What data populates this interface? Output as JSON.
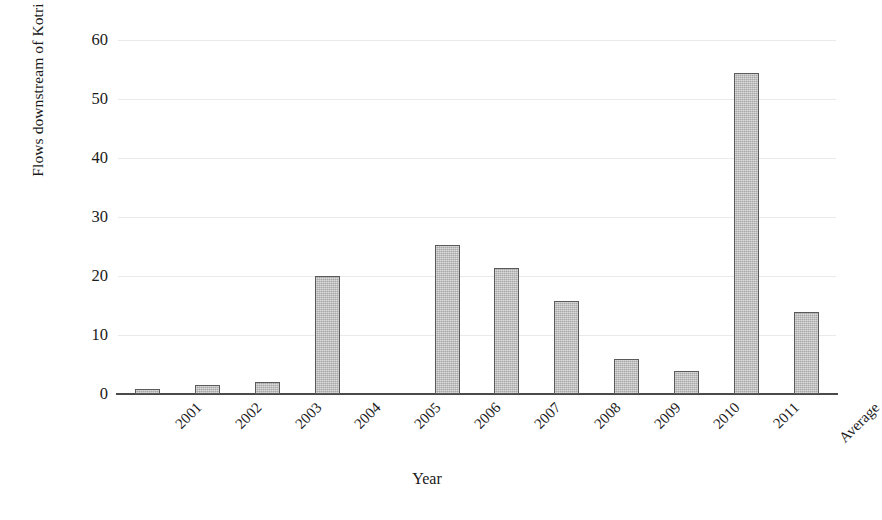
{
  "chart_data": {
    "type": "bar",
    "title": "",
    "xlabel": "Year",
    "ylabel": "Flows downstream of Kotri Barrage ( MAF )",
    "categories": [
      "2001",
      "2002",
      "2003",
      "2004",
      "2005",
      "2006",
      "2007",
      "2008",
      "2009",
      "2010",
      "2011",
      "Average"
    ],
    "values": [
      0.9,
      1.6,
      2.1,
      20.0,
      0.0,
      25.3,
      21.4,
      15.7,
      6.0,
      3.9,
      54.4,
      13.9
    ],
    "ylim": [
      0,
      60
    ],
    "yticks": [
      0,
      10,
      20,
      30,
      40,
      50,
      60
    ],
    "ytick_labels": [
      "0",
      "10",
      "20",
      "30",
      "40",
      "50",
      "60"
    ],
    "grid": true,
    "grid_axis": "y",
    "legend": false,
    "legend_position": "none",
    "bar_color": "#b9b9b9",
    "bar_edge_color": "#5a5a5a",
    "gridline_color": "#e9e9ea",
    "axis_color": "#4a4a4a",
    "text_color": "#1a1a1a",
    "xtick_rotation": -45
  }
}
